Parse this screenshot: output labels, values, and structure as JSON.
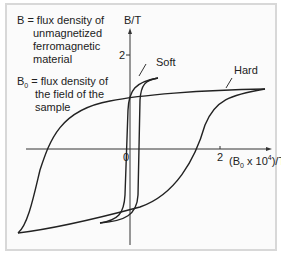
{
  "legend": {
    "line1": "B = flux density of",
    "line2": "unmagnetized",
    "line3": "ferromagnetic",
    "line4": "material",
    "line5": "B",
    "line5_sub": "0",
    "line5_rest": " = flux density of",
    "line6": "the field of the",
    "line7": "sample"
  },
  "axes": {
    "y_label": "B/T",
    "y_tick": "2",
    "origin": "0",
    "x_tick": "2",
    "x_label_pre": "(B",
    "x_label_sub": "0",
    "x_label_mid": " x 10",
    "x_label_sup": "4",
    "x_label_post": ")/T"
  },
  "curves": {
    "soft_label": "Soft",
    "hard_label": "Hard"
  },
  "colors": {
    "line": "#222222",
    "frame": "#d8d8d8",
    "background": "#fbfbfb"
  }
}
